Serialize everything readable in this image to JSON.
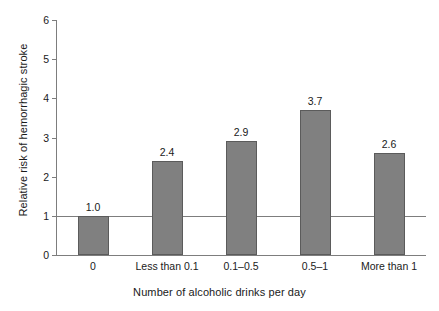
{
  "chart_data": {
    "type": "bar",
    "title": "",
    "xlabel": "Number of alcoholic drinks per day",
    "ylabel": "Relative risk of hemorrhagic stroke",
    "categories": [
      "0",
      "Less than 0.1",
      "0.1–0.5",
      "0.5–1",
      "More than 1"
    ],
    "values": [
      1.0,
      2.4,
      2.9,
      3.7,
      2.6
    ],
    "value_labels": [
      "1.0",
      "2.4",
      "2.9",
      "3.7",
      "2.6"
    ],
    "ylim": [
      0,
      6
    ],
    "yticks": [
      0,
      1,
      2,
      3,
      4,
      5,
      6
    ],
    "ytick_labels": [
      "0",
      "1",
      "2",
      "3",
      "4",
      "5",
      "6"
    ],
    "grid": false,
    "legend": "none",
    "reference_line": {
      "y": 1.0,
      "label": ""
    },
    "bar_color": "#808080",
    "bar_edge_color": "#5b5b5b",
    "axis_color": "#7d7d7d",
    "background": "#ffffff"
  }
}
